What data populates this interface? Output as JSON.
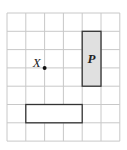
{
  "grid": {
    "columns": 6,
    "rows": 7,
    "origin_x": 7,
    "origin_y": 13,
    "cell_w": 18.8,
    "cell_h": 18.3,
    "line_color": "#c8c8c8"
  },
  "point": {
    "label": "X",
    "col": 2,
    "row": 3
  },
  "shape_p": {
    "label": "P",
    "col": 4,
    "row": 1,
    "width_cells": 1,
    "height_cells": 3,
    "fill": "#e0e0e0",
    "stroke": "#333333"
  },
  "shape_b": {
    "col": 1,
    "row": 5,
    "width_cells": 3,
    "height_cells": 1,
    "fill": "#ffffff",
    "stroke": "#333333"
  }
}
